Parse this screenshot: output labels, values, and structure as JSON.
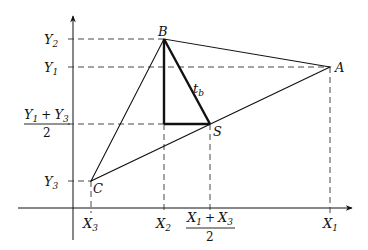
{
  "diagram": {
    "type": "geometry",
    "points": {
      "A": {
        "label": "A",
        "x": 330,
        "y": 67
      },
      "B": {
        "label": "B",
        "x": 164,
        "y": 39
      },
      "C": {
        "label": "C",
        "x": 91,
        "y": 181
      },
      "S": {
        "label": "S",
        "x": 210,
        "y": 124
      }
    },
    "median_label": {
      "base": "t",
      "sub": "b"
    },
    "y_ticks": [
      {
        "base": "Y",
        "sub": "2",
        "y": 39
      },
      {
        "base": "Y",
        "sub": "1",
        "y": 67
      },
      {
        "base": "Y",
        "sub": "3",
        "y": 181
      }
    ],
    "y_fraction": {
      "numerator": {
        "a": "Y",
        "a_sub": "1",
        "op": "+",
        "b": "Y",
        "b_sub": "3"
      },
      "denominator": "2",
      "y": 124
    },
    "x_ticks": [
      {
        "base": "X",
        "sub": "3",
        "x": 91
      },
      {
        "base": "X",
        "sub": "2",
        "x": 164
      },
      {
        "base": "X",
        "sub": "1",
        "x": 330
      }
    ],
    "x_fraction": {
      "numerator": {
        "a": "X",
        "a_sub": "1",
        "op": "+",
        "b": "X",
        "b_sub": "3"
      },
      "denominator": "2",
      "x": 210
    },
    "colors": {
      "line": "#111111",
      "dash": "#333333",
      "background": "#ffffff"
    }
  }
}
